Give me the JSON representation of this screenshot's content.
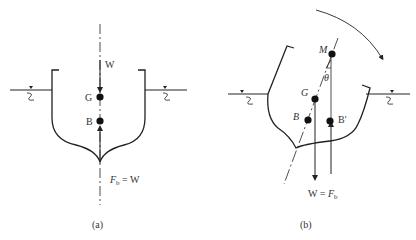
{
  "figure": {
    "panel_a": {
      "caption": "(a)",
      "labels": {
        "weight": "W",
        "center_gravity": "G",
        "center_buoyancy": "B",
        "buoyancy_eq_F": "F",
        "buoyancy_eq_sub": "b",
        "buoyancy_eq_rest": " = W"
      }
    },
    "panel_b": {
      "caption": "(b)",
      "labels": {
        "metacenter": "M",
        "angle": "θ",
        "center_gravity": "G",
        "center_buoyancy": "B",
        "shifted_buoyancy": "B'",
        "eq_left": "W = ",
        "eq_F": "F",
        "eq_sub": "b"
      }
    },
    "colors": {
      "stroke": "#222222",
      "text": "#333333",
      "background": "#ffffff"
    }
  }
}
